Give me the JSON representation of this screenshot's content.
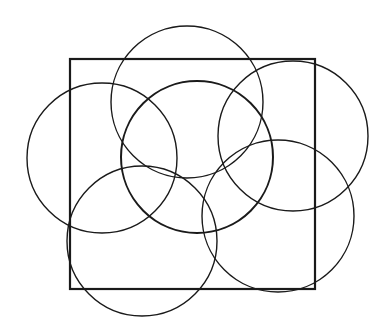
{
  "diagram": {
    "stroke_color": "#1a1a1a",
    "background": "#ffffff",
    "square": {
      "x": 70,
      "y": 59,
      "width": 245,
      "height": 230,
      "stroke_width": 2.2
    },
    "circles": [
      {
        "id": "top",
        "cx": 187,
        "cy": 102,
        "r": 76,
        "stroke_width": 1.4
      },
      {
        "id": "left",
        "cx": 102,
        "cy": 158,
        "r": 75,
        "stroke_width": 1.4
      },
      {
        "id": "center",
        "cx": 197,
        "cy": 157,
        "r": 76,
        "stroke_width": 2.0
      },
      {
        "id": "right",
        "cx": 293,
        "cy": 136,
        "r": 75,
        "stroke_width": 1.4
      },
      {
        "id": "bottom-left",
        "cx": 142,
        "cy": 241,
        "r": 75,
        "stroke_width": 1.4
      },
      {
        "id": "bottom-right",
        "cx": 278,
        "cy": 216,
        "r": 76,
        "stroke_width": 1.4
      }
    ]
  }
}
